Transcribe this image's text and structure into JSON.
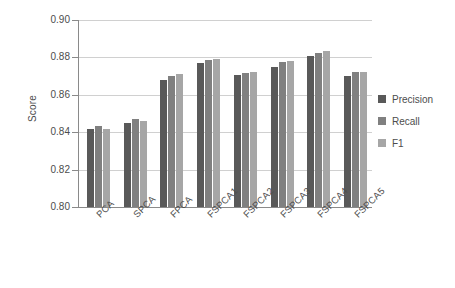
{
  "chart_data": {
    "type": "bar",
    "title": "",
    "xlabel": "",
    "ylabel": "Score",
    "ylim": [
      0.8,
      0.9
    ],
    "yticks": [
      "0.90",
      "0.88",
      "0.86",
      "0.84",
      "0.82",
      "0.80"
    ],
    "ytick_values": [
      0.9,
      0.88,
      0.86,
      0.84,
      0.82,
      0.8
    ],
    "grid": true,
    "legend_position": "right",
    "categories": [
      "PCA",
      "SPCA",
      "FPCA",
      "FSPCA1",
      "FSPCA2",
      "FSPCA3",
      "FSPCA4",
      "FSPCA5"
    ],
    "series": [
      {
        "name": "Precision",
        "color": "#595959",
        "values": [
          0.8415,
          0.845,
          0.868,
          0.8768,
          0.8705,
          0.875,
          0.881,
          0.87
        ]
      },
      {
        "name": "Recall",
        "color": "#808080",
        "values": [
          0.8435,
          0.847,
          0.8698,
          0.8785,
          0.8715,
          0.8775,
          0.8825,
          0.872
        ]
      },
      {
        "name": "F1",
        "color": "#a6a6a6",
        "values": [
          0.8415,
          0.8458,
          0.8712,
          0.8793,
          0.872,
          0.8782,
          0.8832,
          0.8722
        ]
      }
    ]
  },
  "legend": {
    "items": [
      {
        "label": "Precision",
        "color": "#595959"
      },
      {
        "label": "Recall",
        "color": "#808080"
      },
      {
        "label": "F1",
        "color": "#a6a6a6"
      }
    ]
  }
}
